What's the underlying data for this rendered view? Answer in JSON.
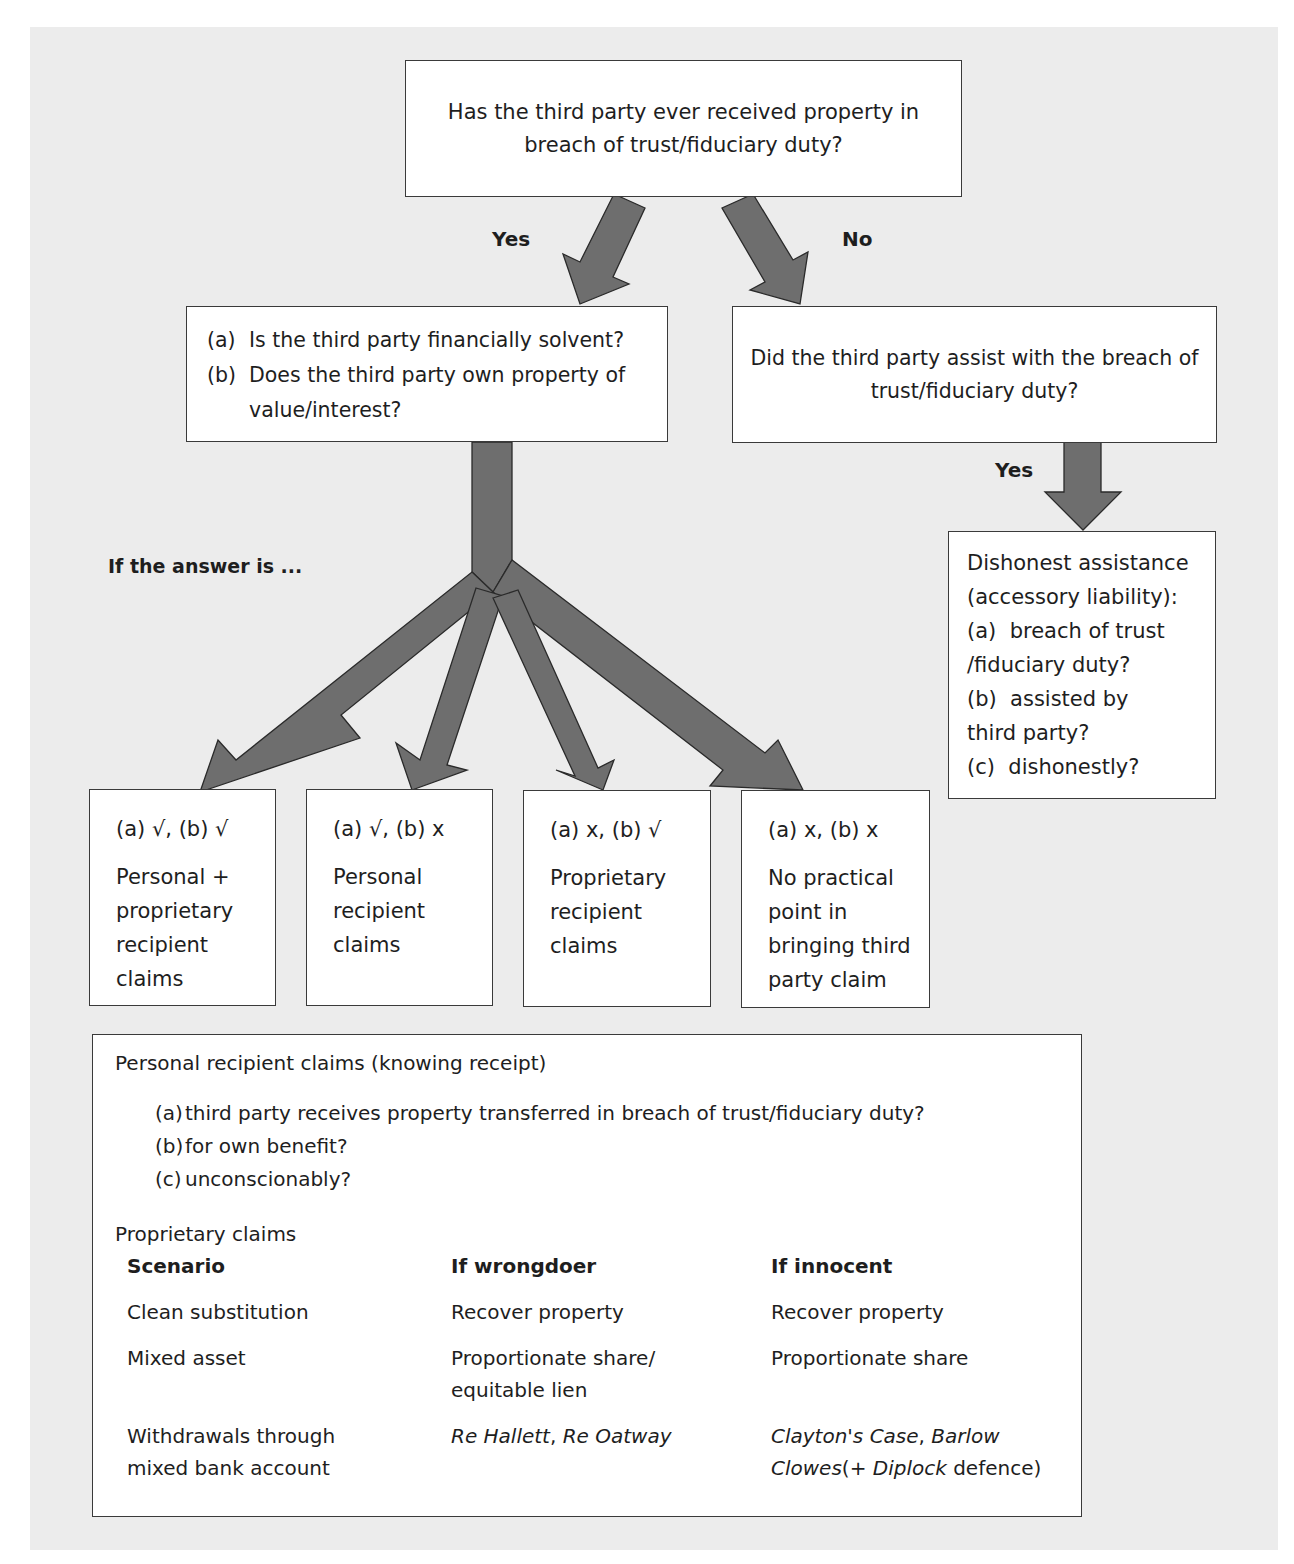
{
  "diagram": {
    "top_question": "Has the third party ever received property in breach of trust/fiduciary duty?",
    "branch_yes_label": "Yes",
    "branch_no_label": "No",
    "solvency_question": {
      "items": [
        {
          "marker": "(a)",
          "text": "Is the third party financially solvent?"
        },
        {
          "marker": "(b)",
          "text": "Does the third party own property of value/interest?"
        }
      ]
    },
    "assist_question": "Did the third party assist with the breach of trust/fiduciary duty?",
    "assist_yes_label": "Yes",
    "if_answer_label": "If the answer is ...",
    "dishonest_assistance": {
      "title_line1": "Dishonest assistance",
      "title_line2": "(accessory liability):",
      "items": [
        {
          "marker": "(a)",
          "line1": "breach of trust",
          "line2": "/fiduciary duty?"
        },
        {
          "marker": "(b)",
          "line1": "assisted by",
          "line2": "third party?"
        },
        {
          "marker": "(c)",
          "line1": "dishonestly?",
          "line2": ""
        }
      ]
    },
    "outcomes": [
      {
        "condition": "(a) √, (b) √",
        "lines": [
          "Personal +",
          "proprietary",
          "recipient",
          "claims"
        ]
      },
      {
        "condition": "(a) √, (b) x",
        "lines": [
          "Personal",
          "recipient",
          "claims"
        ]
      },
      {
        "condition": "(a) x, (b) √",
        "lines": [
          "Proprietary",
          "recipient",
          "claims"
        ]
      },
      {
        "condition": "(a) x, (b) x",
        "lines": [
          "No practical",
          "point in",
          "bringing third",
          "party claim"
        ]
      }
    ],
    "summary": {
      "personal_title": "Personal recipient claims (knowing receipt)",
      "personal_items": [
        {
          "marker": "(a)",
          "text": "third party receives property transferred in breach of trust/fiduciary duty?"
        },
        {
          "marker": "(b)",
          "text": "for own benefit?"
        },
        {
          "marker": "(c)",
          "text": "unconscionably?"
        }
      ],
      "proprietary_title": "Proprietary claims",
      "table": {
        "headers": [
          "Scenario",
          "If wrongdoer",
          "If innocent"
        ],
        "rows": [
          {
            "scenario": "Clean substitution",
            "wrongdoer": "Recover property",
            "innocent": "Recover property"
          },
          {
            "scenario": "Mixed asset",
            "wrongdoer_line1": "Proportionate share/",
            "wrongdoer_line2": "equitable lien",
            "innocent": "Proportionate share"
          },
          {
            "scenario_line1": "Withdrawals through",
            "scenario_line2": "mixed bank account",
            "wrongdoer_case1": "Re Hallett",
            "wrongdoer_sep": ", ",
            "wrongdoer_case2": "Re Oatway",
            "innocent_case1": "Clayton's Case",
            "innocent_sep": ", ",
            "innocent_case2": "Barlow",
            "innocent_case2b": "Clowes",
            "innocent_paren_open": "(+ ",
            "innocent_case3": "Diplock",
            "innocent_tail": " defence)"
          }
        ]
      }
    },
    "colors": {
      "panel": "#ececec",
      "arrow_fill": "#6e6e6e",
      "arrow_stroke": "#2a2a2a",
      "box_border": "#3a3a3a"
    }
  }
}
